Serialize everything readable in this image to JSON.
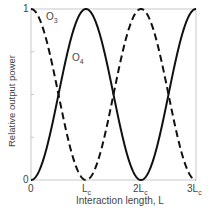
{
  "chart_data": {
    "type": "line",
    "title": "",
    "xlabel": "Interaction length, L",
    "ylabel": "Relative output power",
    "x_ticks": [
      "0",
      "L_c",
      "2L_c",
      "3L_c"
    ],
    "y_ticks": [
      "0",
      "1"
    ],
    "xlim": [
      0,
      3
    ],
    "ylim": [
      0,
      1
    ],
    "grid": false,
    "series": [
      {
        "name": "O3",
        "style": "dashed",
        "function": "cos^2(pi*x/(2))",
        "x": [
          0,
          0.5,
          1,
          1.5,
          2,
          2.5,
          3
        ],
        "values": [
          1,
          0.5,
          0,
          0.5,
          1,
          0.5,
          0
        ]
      },
      {
        "name": "O4",
        "style": "solid",
        "function": "sin^2(pi*x/(2))",
        "x": [
          0,
          0.5,
          1,
          1.5,
          2,
          2.5,
          3
        ],
        "values": [
          0,
          0.5,
          1,
          0.5,
          0,
          0.5,
          1
        ]
      }
    ]
  },
  "labels": {
    "y_top": "1",
    "y_bottom": "0",
    "x0": "0",
    "x1": "L",
    "x1_sub": "c",
    "x2": "2L",
    "x2_sub": "c",
    "x3": "3L",
    "x3_sub": "c",
    "o3": "O",
    "o3_sub": "3",
    "o4": "O",
    "o4_sub": "4",
    "xlabel": "Interaction length, L",
    "ylabel": "Relative output power"
  }
}
